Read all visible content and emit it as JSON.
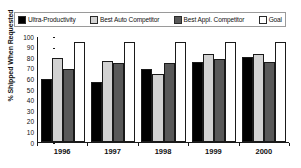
{
  "chart_data": {
    "type": "bar",
    "title": "",
    "xlabel": "",
    "ylabel": "% Shipped When Requested",
    "ylim": [
      0,
      100
    ],
    "ytick_step": 10,
    "yticks": [
      "100",
      "90",
      "80",
      "70",
      "60",
      "50",
      "40",
      "30",
      "20",
      "10",
      "0"
    ],
    "grid": false,
    "legend_position": "top",
    "categories": [
      "1996",
      "1997",
      "1998",
      "1999",
      "2000"
    ],
    "series": [
      {
        "name": "Ultra-Productivity",
        "color": "#000000",
        "values": [
          60,
          57,
          70,
          76,
          81
        ]
      },
      {
        "name": "Best Auto Competitor",
        "color": "#d2d2d2",
        "values": [
          80,
          77,
          65,
          84,
          84
        ]
      },
      {
        "name": "Best Appl. Competitor",
        "color": "#595959",
        "values": [
          70,
          75,
          75,
          79,
          76
        ]
      },
      {
        "name": "Goal",
        "color": "#ffffff",
        "values": [
          95,
          95,
          95,
          95,
          95
        ]
      }
    ]
  },
  "legend": {
    "items": [
      {
        "label": "Ultra-Productivity",
        "color": "#000000"
      },
      {
        "label": "Best Auto Competitor",
        "color": "#d2d2d2"
      },
      {
        "label": "Best Appl. Competitor",
        "color": "#595959"
      },
      {
        "label": "Goal",
        "color": "#ffffff"
      }
    ]
  }
}
